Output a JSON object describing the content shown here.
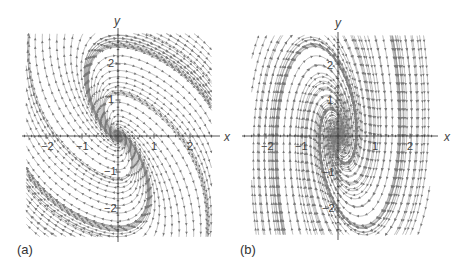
{
  "figure": {
    "panels": [
      {
        "id": "a",
        "tag": "(a)",
        "x_axis_label": "x",
        "y_axis_label": "y",
        "x_ticks": [
          "−2",
          "−1",
          "1",
          "2"
        ],
        "y_ticks": [
          "2",
          "1",
          "−1",
          "−2"
        ],
        "system": "lienard",
        "description": "Phase portrait with S-shaped attracting curve through origin; peak near (-2, 2.7), trough near (2, -2.7)"
      },
      {
        "id": "b",
        "tag": "(b)",
        "x_axis_label": "x",
        "y_axis_label": "y",
        "x_ticks": [
          "−2",
          "−1",
          "1",
          "2"
        ],
        "y_ticks": [
          "2",
          "1",
          "−1",
          "−2"
        ],
        "system": "spiral",
        "description": "Phase portrait with stable spiral at origin; nearly vertical flow, upward for x<0 and downward for x>0"
      }
    ],
    "colors": {
      "stream": "#8a8a8a",
      "axis": "#444444",
      "text": "#333333"
    }
  }
}
